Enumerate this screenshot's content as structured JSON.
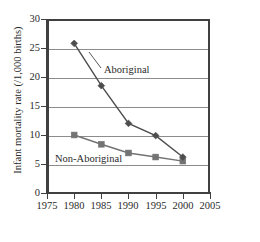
{
  "chart_data": {
    "type": "line",
    "title": "",
    "xlabel": "Year",
    "ylabel": "Infant mortality rate (/1,000 births)",
    "x": [
      1980,
      1985,
      1990,
      1995,
      2000
    ],
    "xlim": [
      1975,
      2005
    ],
    "ylim": [
      0,
      30
    ],
    "xticks": [
      1975,
      1980,
      1985,
      1990,
      1995,
      2000,
      2005
    ],
    "yticks": [
      0,
      5,
      10,
      15,
      20,
      25,
      30
    ],
    "gridlines": [
      5,
      10,
      15,
      20,
      25
    ],
    "grid": "horizontal",
    "legend_position": "inline-annotation",
    "series": [
      {
        "name": "Aboriginal",
        "marker": "diamond",
        "color": "#4d4d4d",
        "values": [
          25.8,
          18.5,
          12.0,
          9.9,
          6.2
        ]
      },
      {
        "name": "Non-Aboriginal",
        "marker": "square",
        "color": "#737373",
        "values": [
          10.0,
          8.4,
          6.9,
          6.2,
          5.5
        ]
      }
    ],
    "annotations": [
      {
        "text": "Aboriginal",
        "x": 1990,
        "y": 21.5
      },
      {
        "text": "Non-Aboriginal",
        "x": 1981,
        "y": 7.0
      }
    ]
  },
  "axes": {
    "y_title": "Infant mortality rate (/1,000 births)",
    "x_title": "Year",
    "y_tick_labels": [
      "30",
      "25",
      "20",
      "15",
      "10",
      "5",
      "0"
    ],
    "x_tick_labels": [
      "1975",
      "1980",
      "1985",
      "1990",
      "1995",
      "2000",
      "2005"
    ]
  },
  "labels": {
    "aboriginal": "Aboriginal",
    "non_aboriginal": "Non-Aboriginal"
  },
  "colors": {
    "axis": "#404040",
    "grid": "#8c8c8c",
    "series_aboriginal": "#4d4d4d",
    "series_non_aboriginal": "#737373",
    "background": "#ffffff"
  }
}
